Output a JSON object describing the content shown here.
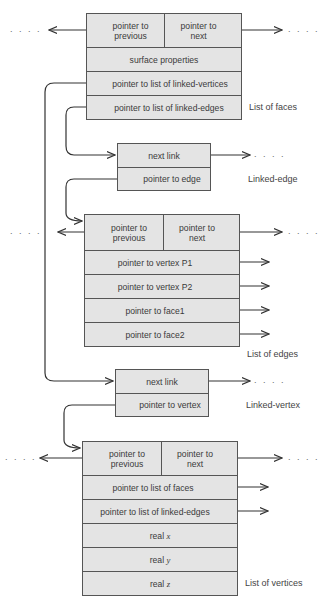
{
  "faces": {
    "title": "List of faces",
    "prev": "pointer to\nprevious",
    "prev_1": "pointer to",
    "prev_2": "previous",
    "next_1": "pointer to",
    "next_2": "next",
    "rows": [
      "surface properties",
      "pointer to list of linked-vertices",
      "pointer to list of linked-edges"
    ]
  },
  "linked_edge": {
    "title": "Linked-edge",
    "rows": [
      "next link",
      "pointer to edge"
    ]
  },
  "edges": {
    "title": "List of edges",
    "prev_1": "pointer to",
    "prev_2": "previous",
    "next_1": "pointer to",
    "next_2": "next",
    "rows": [
      "pointer to vertex P1",
      "pointer to vertex P2",
      "pointer to face1",
      "pointer to face2"
    ]
  },
  "linked_vertex": {
    "title": "Linked-vertex",
    "rows": [
      "next link",
      "pointer to vertex"
    ]
  },
  "vertices": {
    "title": "List of vertices",
    "prev_1": "pointer to",
    "prev_2": "previous",
    "next_1": "pointer to",
    "next_2": "next",
    "rows": [
      "pointer to list of faces",
      "pointer to list of linked-edges"
    ],
    "coords": [
      {
        "prefix": "real",
        "var": "x"
      },
      {
        "prefix": "real",
        "var": "y"
      },
      {
        "prefix": "real",
        "var": "z"
      }
    ]
  },
  "ellipsis": ". . . .",
  "colors": {
    "fill": "#e4e4e4",
    "stroke": "#555555",
    "line": "#333333"
  }
}
